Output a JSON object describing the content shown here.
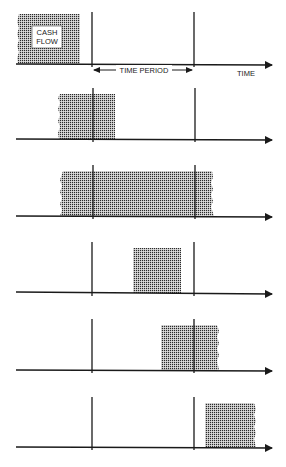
{
  "diagram": {
    "type": "cash-flow-time-period-timing",
    "labels": {
      "cash_flow_line1": "CASH",
      "cash_flow_line2": "FLOW",
      "time_period": "TIME PERIOD",
      "time_axis": "TIME"
    },
    "colors": {
      "ink": "#1a1a1a",
      "dot": "#2a2a2a",
      "background": "#ffffff"
    },
    "period_start_x": 92,
    "period_end_x": 194,
    "axis_start_x": 16,
    "axis_end_x": 272,
    "panels": [
      {
        "id": 1,
        "axis_y": 64,
        "line_top": 12,
        "box": {
          "x": 17,
          "y": 14,
          "w": 63,
          "h": 50
        },
        "ragged_left": true,
        "ragged_right": false,
        "relation": "before period"
      },
      {
        "id": 2,
        "axis_y": 139,
        "line_top": 88,
        "box": {
          "x": 58,
          "y": 94,
          "w": 57,
          "h": 45
        },
        "ragged_left": true,
        "ragged_right": false,
        "relation": "overlaps period start"
      },
      {
        "id": 3,
        "axis_y": 216,
        "line_top": 165,
        "box": {
          "x": 61,
          "y": 171,
          "w": 153,
          "h": 45
        },
        "ragged_left": true,
        "ragged_right": true,
        "relation": "spans entire period"
      },
      {
        "id": 4,
        "axis_y": 293,
        "line_top": 242,
        "box": {
          "x": 133,
          "y": 248,
          "w": 48,
          "h": 45
        },
        "ragged_left": false,
        "ragged_right": false,
        "relation": "within period"
      },
      {
        "id": 5,
        "axis_y": 370,
        "line_top": 319,
        "box": {
          "x": 161,
          "y": 325,
          "w": 58,
          "h": 45
        },
        "ragged_left": false,
        "ragged_right": true,
        "relation": "overlaps period end"
      },
      {
        "id": 6,
        "axis_y": 447,
        "line_top": 397,
        "box": {
          "x": 205,
          "y": 403,
          "w": 51,
          "h": 44
        },
        "ragged_left": false,
        "ragged_right": true,
        "relation": "after period"
      }
    ]
  }
}
